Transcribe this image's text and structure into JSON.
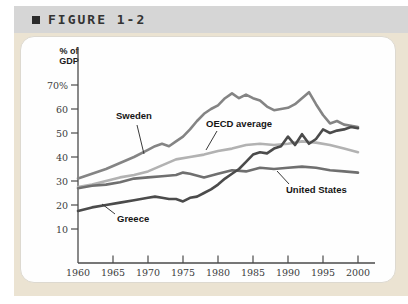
{
  "figure": {
    "bullet": "■",
    "label": "FIGURE 1-2"
  },
  "chart_data": {
    "type": "line",
    "title": "FIGURE 1-2",
    "ylabel": "% of GDP",
    "ylabel_lines": [
      "% of",
      "GDP"
    ],
    "xlabel": "",
    "x_range": [
      1960,
      2002
    ],
    "y_range": [
      0,
      75
    ],
    "grid": false,
    "legend_position": "inline-annotations",
    "x_ticks": [
      "1960",
      "1965",
      "1970",
      "1975",
      "1980",
      "1985",
      "1990",
      "1995",
      "2000"
    ],
    "y_ticks": [
      10,
      20,
      30,
      40,
      50,
      60,
      70
    ],
    "y_tick_labels": [
      "10",
      "20",
      "30",
      "40",
      "50",
      "60",
      "70%"
    ],
    "series": [
      {
        "name": "Sweden",
        "color": "#848484",
        "points": [
          [
            1960,
            31
          ],
          [
            1962,
            33
          ],
          [
            1964,
            35
          ],
          [
            1966,
            37.5
          ],
          [
            1968,
            40
          ],
          [
            1970,
            43
          ],
          [
            1971,
            44.5
          ],
          [
            1972,
            45.5
          ],
          [
            1973,
            44.5
          ],
          [
            1974,
            46.5
          ],
          [
            1975,
            48.5
          ],
          [
            1976,
            51.5
          ],
          [
            1977,
            55
          ],
          [
            1978,
            58
          ],
          [
            1979,
            60
          ],
          [
            1980,
            61.5
          ],
          [
            1981,
            64.5
          ],
          [
            1982,
            66.5
          ],
          [
            1983,
            64.5
          ],
          [
            1984,
            66
          ],
          [
            1985,
            64.5
          ],
          [
            1986,
            63.5
          ],
          [
            1987,
            61
          ],
          [
            1988,
            59.5
          ],
          [
            1989,
            60
          ],
          [
            1990,
            60.5
          ],
          [
            1991,
            62
          ],
          [
            1992,
            64.5
          ],
          [
            1993,
            67
          ],
          [
            1994,
            62
          ],
          [
            1995,
            57.5
          ],
          [
            1996,
            54
          ],
          [
            1997,
            55
          ],
          [
            1998,
            53.5
          ],
          [
            1999,
            53
          ],
          [
            2000,
            52.5
          ]
        ]
      },
      {
        "name": "OECD average",
        "color": "#b2b2b2",
        "points": [
          [
            1960,
            27.5
          ],
          [
            1962,
            28.5
          ],
          [
            1964,
            30
          ],
          [
            1966,
            31.5
          ],
          [
            1968,
            32.5
          ],
          [
            1970,
            34
          ],
          [
            1972,
            36.5
          ],
          [
            1974,
            39
          ],
          [
            1976,
            40
          ],
          [
            1978,
            41
          ],
          [
            1980,
            42.5
          ],
          [
            1982,
            43.5
          ],
          [
            1984,
            45
          ],
          [
            1986,
            45.5
          ],
          [
            1988,
            45
          ],
          [
            1990,
            45.5
          ],
          [
            1992,
            46.5
          ],
          [
            1994,
            46
          ],
          [
            1996,
            45
          ],
          [
            1998,
            43.5
          ],
          [
            2000,
            42
          ]
        ]
      },
      {
        "name": "United States",
        "color": "#6f6f6f",
        "points": [
          [
            1960,
            27
          ],
          [
            1962,
            28
          ],
          [
            1964,
            28.5
          ],
          [
            1966,
            29.5
          ],
          [
            1968,
            31
          ],
          [
            1970,
            31.5
          ],
          [
            1972,
            32
          ],
          [
            1974,
            32.5
          ],
          [
            1975,
            33.5
          ],
          [
            1976,
            33
          ],
          [
            1978,
            31.5
          ],
          [
            1980,
            33
          ],
          [
            1982,
            34.5
          ],
          [
            1984,
            34
          ],
          [
            1986,
            35.5
          ],
          [
            1988,
            35
          ],
          [
            1990,
            35.5
          ],
          [
            1992,
            36
          ],
          [
            1994,
            35.5
          ],
          [
            1996,
            34.5
          ],
          [
            1998,
            34
          ],
          [
            2000,
            33.5
          ]
        ]
      },
      {
        "name": "Greece",
        "color": "#4b4b4b",
        "points": [
          [
            1960,
            17.5
          ],
          [
            1962,
            19
          ],
          [
            1964,
            20
          ],
          [
            1966,
            21
          ],
          [
            1968,
            22
          ],
          [
            1970,
            23
          ],
          [
            1971,
            23.5
          ],
          [
            1972,
            23
          ],
          [
            1973,
            22.5
          ],
          [
            1974,
            22.5
          ],
          [
            1975,
            21.5
          ],
          [
            1976,
            23
          ],
          [
            1977,
            23.5
          ],
          [
            1978,
            25
          ],
          [
            1979,
            26.5
          ],
          [
            1980,
            28.5
          ],
          [
            1981,
            31
          ],
          [
            1982,
            33
          ],
          [
            1983,
            35
          ],
          [
            1984,
            38
          ],
          [
            1985,
            41
          ],
          [
            1986,
            42
          ],
          [
            1987,
            41.5
          ],
          [
            1988,
            43.5
          ],
          [
            1989,
            44.5
          ],
          [
            1990,
            48.5
          ],
          [
            1991,
            45
          ],
          [
            1992,
            49.5
          ],
          [
            1993,
            45.5
          ],
          [
            1994,
            47.5
          ],
          [
            1995,
            51.5
          ],
          [
            1996,
            50
          ],
          [
            1997,
            51
          ],
          [
            1998,
            51.5
          ],
          [
            1999,
            52.5
          ],
          [
            2000,
            52
          ]
        ]
      }
    ]
  }
}
